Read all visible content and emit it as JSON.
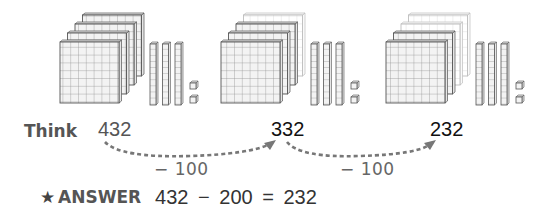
{
  "figure": {
    "groups": [
      {
        "value": 432,
        "hundreds": 4,
        "hundreds_faded": 0,
        "tens": 3,
        "ones": 2
      },
      {
        "value": 332,
        "hundreds": 4,
        "hundreds_faded": 1,
        "tens": 3,
        "ones": 2
      },
      {
        "value": 232,
        "hundreds": 4,
        "hundreds_faded": 2,
        "tens": 3,
        "ones": 2
      }
    ],
    "colors": {
      "block_fill": "#f2f2f2",
      "block_stroke": "#666666",
      "faded_stroke": "#bbbbbb",
      "arrow": "#777777"
    }
  },
  "think": {
    "label": "Think",
    "start": "432",
    "mid": "332",
    "end": "232",
    "step1": "− 100",
    "step2": "− 100"
  },
  "answer": {
    "star_icon": "★",
    "label": "ANSWER",
    "expression": "432 − 200 = 232"
  }
}
